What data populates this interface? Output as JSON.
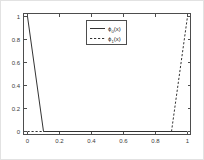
{
  "chart_data": {
    "type": "line",
    "title": "",
    "xlabel": "",
    "ylabel": "",
    "xlim": [
      -0.05,
      1.05
    ],
    "ylim": [
      -0.05,
      1.05
    ],
    "grid": false,
    "legend_position": "upper center",
    "xticks": [
      0,
      0.2,
      0.4,
      0.6,
      0.8,
      1
    ],
    "xticklabels": [
      "0",
      "0.2",
      "0.4",
      "0.6",
      "0.8",
      "1"
    ],
    "yticks": [
      0,
      0.2,
      0.4,
      0.6,
      0.8,
      1
    ],
    "yticklabels": [
      "0",
      "0.2",
      "0.4",
      "0.6",
      "0.8",
      "1"
    ],
    "series": [
      {
        "name": "phi_0(x)",
        "label_base": "ϕ",
        "label_sub": "0",
        "label_tail": "(x)",
        "style": "solid",
        "color": "#333333",
        "x": [
          0,
          0.1,
          1
        ],
        "values": [
          1,
          0,
          0
        ]
      },
      {
        "name": "phi_1(x)",
        "label_base": "ϕ",
        "label_sub": "1",
        "label_tail": "(x)",
        "style": "dashed",
        "color": "#333333",
        "x": [
          0,
          0.9,
          1
        ],
        "values": [
          0,
          0,
          1
        ]
      }
    ]
  },
  "legend": {
    "entry_0": {
      "base": "ϕ",
      "sub": "0",
      "tail": "(x)"
    },
    "entry_1": {
      "base": "ϕ",
      "sub": "1",
      "tail": "(x)"
    }
  },
  "ticks": {
    "x": {
      "t0": "0",
      "t1": "0.2",
      "t2": "0.4",
      "t3": "0.6",
      "t4": "0.8",
      "t5": "1"
    },
    "y": {
      "t0": "0",
      "t1": "0.2",
      "t2": "0.4",
      "t3": "0.6",
      "t4": "0.8",
      "t5": "1"
    }
  }
}
